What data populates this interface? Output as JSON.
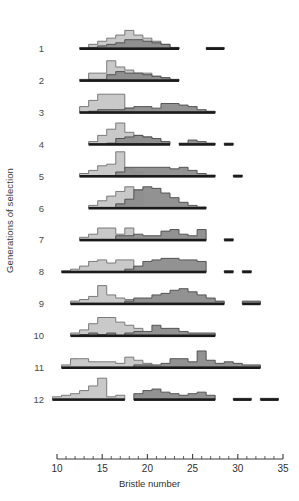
{
  "axes": {
    "xlabel": "Bristle number",
    "ylabel": "Generations of selection",
    "x_ticks_major": [
      10,
      15,
      20,
      25,
      30,
      35
    ],
    "x_tick_labels": [
      "10",
      "15",
      "20",
      "25",
      "30",
      "35"
    ],
    "row_labels": [
      "1",
      "2",
      "3",
      "4",
      "5",
      "6",
      "7",
      "8",
      "9",
      "10",
      "11",
      "12"
    ]
  },
  "colors": {
    "light_fill": "#c9c9c9",
    "light_stroke": "#6e6e6e",
    "dark_fill": "#8c8c8c",
    "dark_stroke": "#4a4a4a",
    "baseline": "#1a1a1a",
    "axis": "#3a3a3a",
    "text": "#2f2f2f"
  },
  "chart_data": {
    "type": "bar",
    "title": "",
    "subtitle": "",
    "xlabel": "Bristle number",
    "ylabel": "Generations of selection",
    "xlim": [
      9.5,
      35.5
    ],
    "grid": false,
    "legend_position": "none",
    "x_tick_labels": [
      "10",
      "15",
      "20",
      "25",
      "30",
      "35"
    ],
    "x_ticks_major": [
      10,
      15,
      20,
      25,
      30,
      35
    ],
    "x_ticks_minor_step": 1,
    "bin_width": 1,
    "panels": [
      {
        "row_label": "1",
        "series": [
          {
            "name": "low-line",
            "color": "#c9c9c9",
            "x": [
              13,
              14,
              15,
              16,
              17,
              18,
              19,
              20,
              21,
              22,
              23
            ],
            "values": [
              1,
              3,
              5,
              7,
              9,
              12,
              9,
              7,
              5,
              3,
              1
            ]
          },
          {
            "name": "high-line",
            "color": "#8c8c8c",
            "x": [
              14,
              15,
              16,
              17,
              18,
              19,
              20,
              21,
              22,
              23,
              27,
              28
            ],
            "values": [
              1,
              2,
              3,
              4,
              6,
              6,
              5,
              4,
              3,
              1,
              1,
              1
            ]
          }
        ]
      },
      {
        "row_label": "2",
        "series": [
          {
            "name": "low-line",
            "color": "#c9c9c9",
            "x": [
              13,
              14,
              15,
              16,
              17,
              18,
              19,
              20,
              21,
              22
            ],
            "values": [
              1,
              5,
              5,
              13,
              9,
              7,
              5,
              5,
              3,
              2
            ]
          },
          {
            "name": "high-line",
            "color": "#8c8c8c",
            "x": [
              14,
              15,
              16,
              17,
              18,
              19,
              20,
              21,
              22,
              23
            ],
            "values": [
              1,
              1,
              4,
              6,
              5,
              5,
              4,
              3,
              2,
              1
            ]
          }
        ]
      },
      {
        "row_label": "3",
        "series": [
          {
            "name": "low-line",
            "color": "#c9c9c9",
            "x": [
              13,
              14,
              15,
              16,
              17,
              18
            ],
            "values": [
              4,
              8,
              12,
              12,
              12,
              3
            ]
          },
          {
            "name": "high-line",
            "color": "#8c8c8c",
            "x": [
              14,
              15,
              16,
              17,
              18,
              19,
              20,
              21,
              22,
              23,
              24,
              25,
              26,
              27
            ],
            "values": [
              1,
              2,
              2,
              2,
              3,
              4,
              4,
              3,
              6,
              6,
              5,
              4,
              2,
              1
            ]
          }
        ]
      },
      {
        "row_label": "4",
        "series": [
          {
            "name": "low-line",
            "color": "#c9c9c9",
            "x": [
              14,
              15,
              16,
              17,
              18,
              19,
              20,
              21
            ],
            "values": [
              2,
              6,
              10,
              14,
              8,
              6,
              5,
              3
            ]
          },
          {
            "name": "high-line",
            "color": "#8c8c8c",
            "x": [
              16,
              17,
              18,
              19,
              20,
              21,
              22,
              24,
              25,
              26,
              27,
              29
            ],
            "values": [
              1,
              4,
              5,
              6,
              5,
              4,
              2,
              1,
              3,
              2,
              1,
              1
            ]
          }
        ]
      },
      {
        "row_label": "5",
        "series": [
          {
            "name": "low-line",
            "color": "#c9c9c9",
            "x": [
              13,
              14,
              15,
              16,
              17,
              18,
              19
            ],
            "values": [
              2,
              4,
              7,
              8,
              16,
              5,
              3
            ]
          },
          {
            "name": "high-line",
            "color": "#8c8c8c",
            "x": [
              17,
              18,
              19,
              20,
              21,
              22,
              23,
              24,
              25,
              26,
              27,
              30
            ],
            "values": [
              3,
              6,
              6,
              6,
              6,
              6,
              5,
              6,
              4,
              2,
              1,
              1
            ]
          }
        ]
      },
      {
        "row_label": "6",
        "series": [
          {
            "name": "low-line",
            "color": "#c9c9c9",
            "x": [
              14,
              15,
              16,
              17,
              18,
              19
            ],
            "values": [
              2,
              5,
              8,
              11,
              14,
              12
            ]
          },
          {
            "name": "high-line",
            "color": "#8c8c8c",
            "x": [
              17,
              18,
              19,
              20,
              21,
              22,
              23,
              24,
              25,
              26
            ],
            "values": [
              3,
              6,
              12,
              14,
              13,
              10,
              7,
              4,
              2,
              1
            ]
          }
        ]
      },
      {
        "row_label": "7",
        "series": [
          {
            "name": "low-line",
            "color": "#c9c9c9",
            "x": [
              13,
              14,
              15,
              16,
              17,
              18
            ],
            "values": [
              2,
              4,
              8,
              8,
              4,
              8
            ]
          },
          {
            "name": "high-line",
            "color": "#8c8c8c",
            "x": [
              17,
              18,
              19,
              20,
              21,
              22,
              23,
              24,
              25,
              26,
              29
            ],
            "values": [
              3,
              3,
              4,
              3,
              3,
              6,
              7,
              4,
              3,
              7,
              1
            ]
          }
        ]
      },
      {
        "row_label": "8",
        "series": [
          {
            "name": "low-line",
            "color": "#c9c9c9",
            "x": [
              11,
              12,
              13,
              14,
              15,
              16,
              17,
              18
            ],
            "values": [
              1,
              2,
              4,
              7,
              8,
              6,
              8,
              8
            ]
          },
          {
            "name": "high-line",
            "color": "#8c8c8c",
            "x": [
              18,
              19,
              20,
              21,
              22,
              23,
              24,
              25,
              26,
              29,
              31
            ],
            "values": [
              2,
              4,
              7,
              8,
              9,
              9,
              8,
              8,
              7,
              1,
              1
            ]
          }
        ]
      },
      {
        "row_label": "9",
        "series": [
          {
            "name": "low-line",
            "color": "#c9c9c9",
            "x": [
              12,
              13,
              14,
              15,
              16,
              17,
              18
            ],
            "values": [
              2,
              3,
              5,
              12,
              6,
              4,
              3
            ]
          },
          {
            "name": "high-line",
            "color": "#8c8c8c",
            "x": [
              18,
              19,
              20,
              21,
              22,
              23,
              24,
              25,
              26,
              27,
              28,
              31,
              32
            ],
            "values": [
              2,
              4,
              4,
              6,
              7,
              9,
              10,
              8,
              6,
              4,
              2,
              2,
              2
            ]
          }
        ]
      },
      {
        "row_label": "10",
        "series": [
          {
            "name": "low-line",
            "color": "#c9c9c9",
            "x": [
              12,
              13,
              14,
              15,
              16,
              17,
              18,
              19
            ],
            "values": [
              2,
              4,
              8,
              12,
              12,
              9,
              7,
              5
            ]
          },
          {
            "name": "high-line",
            "color": "#8c8c8c",
            "x": [
              13,
              14,
              15,
              16,
              18,
              19,
              20,
              21,
              22,
              23,
              24,
              25,
              26,
              27
            ],
            "values": [
              1,
              2,
              1,
              2,
              2,
              3,
              3,
              7,
              5,
              5,
              3,
              2,
              2,
              2
            ]
          }
        ]
      },
      {
        "row_label": "11",
        "series": [
          {
            "name": "low-line",
            "color": "#c9c9c9",
            "x": [
              11,
              12,
              13,
              14,
              15,
              16,
              17,
              18,
              19,
              20
            ],
            "values": [
              2,
              6,
              6,
              4,
              4,
              4,
              3,
              7,
              5,
              3
            ]
          },
          {
            "name": "high-line",
            "color": "#8c8c8c",
            "x": [
              19,
              20,
              21,
              22,
              23,
              24,
              25,
              26,
              27,
              28,
              29,
              30,
              31,
              32
            ],
            "values": [
              2,
              2,
              2,
              3,
              6,
              6,
              4,
              11,
              5,
              3,
              4,
              3,
              2,
              2
            ]
          }
        ]
      },
      {
        "row_label": "12",
        "series": [
          {
            "name": "low-line",
            "color": "#c9c9c9",
            "x": [
              10,
              11,
              12,
              13,
              14,
              15,
              16,
              17
            ],
            "values": [
              2,
              3,
              4,
              6,
              9,
              14,
              2,
              3
            ]
          },
          {
            "name": "high-line",
            "color": "#8c8c8c",
            "x": [
              19,
              20,
              21,
              22,
              23,
              24,
              25,
              26,
              27,
              30,
              31,
              33,
              34
            ],
            "values": [
              4,
              6,
              7,
              5,
              4,
              3,
              4,
              5,
              3,
              1,
              1,
              1,
              1
            ]
          }
        ]
      }
    ]
  }
}
